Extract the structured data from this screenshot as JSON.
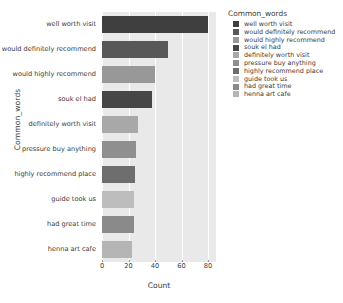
{
  "chart_data": {
    "type": "bar",
    "orientation": "horizontal",
    "title": "",
    "xlabel": "Count",
    "ylabel": "Common_words",
    "xlim": [
      0,
      86
    ],
    "xticks": [
      0,
      20,
      40,
      60,
      80
    ],
    "grid": true,
    "categories": [
      "well worth visit",
      "would definitely recommend",
      "would highly recommend",
      "souk el had",
      "definitely worth visit",
      "pressure buy anything",
      "highly recommend place",
      "guide took us",
      "had great time",
      "henna art cafe"
    ],
    "values": [
      80,
      50,
      40,
      38,
      27,
      26,
      25,
      24,
      24,
      23
    ],
    "colors": [
      "#3f3f3f",
      "#585858",
      "#989898",
      "#464646",
      "#a8a8a8",
      "#8f8f8f",
      "#6e6e6e",
      "#bdbdbd",
      "#8a8a8a",
      "#b5b5b5"
    ],
    "legend": {
      "title": "Common_words",
      "position": "right",
      "entries": [
        {
          "label": "well worth visit",
          "color": "#3f3f3f"
        },
        {
          "label": "would definitely recommend",
          "color": "#585858"
        },
        {
          "label": "would highly recommend",
          "color": "#989898"
        },
        {
          "label": "souk el had",
          "color": "#464646"
        },
        {
          "label": "definitely worth visit",
          "color": "#a8a8a8"
        },
        {
          "label": "pressure buy anything",
          "color": "#8f8f8f"
        },
        {
          "label": "highly recommend place",
          "color": "#6e6e6e"
        },
        {
          "label": "guide took us",
          "color": "#bdbdbd"
        },
        {
          "label": "had great time",
          "color": "#8a8a8a"
        },
        {
          "label": "henna art cafe",
          "color": "#b5b5b5"
        }
      ]
    },
    "style": {
      "plot_background": "#e9e9e9",
      "grid_color": "#ffffff",
      "text_color": "#3a3a3a"
    }
  }
}
